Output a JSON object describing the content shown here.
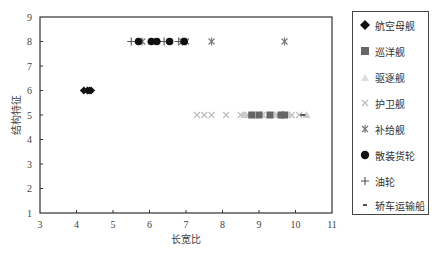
{
  "chart_data": {
    "type": "scatter",
    "title": "",
    "xlabel": "长宽比",
    "ylabel": "结构特征",
    "xlim": [
      3,
      11
    ],
    "ylim": [
      1,
      9
    ],
    "x_ticks": [
      3,
      4,
      5,
      6,
      7,
      8,
      9,
      10,
      11
    ],
    "y_ticks": [
      1,
      2,
      3,
      4,
      5,
      6,
      7,
      8,
      9
    ],
    "grid": false,
    "legend_position": "right",
    "series": [
      {
        "name": "航空母舰",
        "marker": "diamond",
        "color": "#111111",
        "points": [
          [
            4.2,
            6
          ],
          [
            4.3,
            6
          ],
          [
            4.35,
            6
          ],
          [
            4.4,
            6
          ]
        ]
      },
      {
        "name": "巡洋舰",
        "marker": "square",
        "color": "#666666",
        "points": [
          [
            8.8,
            5
          ],
          [
            9.0,
            5
          ],
          [
            9.3,
            5
          ],
          [
            9.6,
            5
          ],
          [
            9.7,
            5
          ]
        ]
      },
      {
        "name": "驱逐舰",
        "marker": "triangle",
        "color": "#cccccc",
        "points": [
          [
            8.6,
            5
          ],
          [
            8.8,
            5
          ],
          [
            9.1,
            5
          ],
          [
            9.4,
            5
          ],
          [
            9.8,
            5
          ],
          [
            10.3,
            5
          ]
        ]
      },
      {
        "name": "护卫舰",
        "marker": "x",
        "color": "#bbbbbb",
        "points": [
          [
            7.3,
            5
          ],
          [
            7.5,
            5
          ],
          [
            7.7,
            5
          ],
          [
            8.1,
            5
          ],
          [
            8.5,
            5
          ],
          [
            8.7,
            5
          ],
          [
            9.1,
            5
          ],
          [
            9.5,
            5
          ],
          [
            9.9,
            5
          ],
          [
            10.1,
            5
          ]
        ]
      },
      {
        "name": "补给舰",
        "marker": "asterisk",
        "color": "#777777",
        "points": [
          [
            5.8,
            8
          ],
          [
            6.9,
            8
          ],
          [
            7.0,
            8
          ],
          [
            7.7,
            8
          ],
          [
            9.7,
            8
          ]
        ]
      },
      {
        "name": "散装货轮",
        "marker": "circle",
        "color": "#111111",
        "points": [
          [
            5.7,
            8
          ],
          [
            6.05,
            8
          ],
          [
            6.2,
            8
          ],
          [
            6.55,
            8
          ],
          [
            6.95,
            8
          ]
        ]
      },
      {
        "name": "油轮",
        "marker": "plus",
        "color": "#555555",
        "points": [
          [
            5.5,
            8
          ],
          [
            6.4,
            8
          ],
          [
            6.8,
            8
          ]
        ]
      },
      {
        "name": "轿车运输船",
        "marker": "dash",
        "color": "#555555",
        "points": [
          [
            10.2,
            5
          ]
        ]
      }
    ]
  },
  "axes": {
    "xlabel": "长宽比",
    "ylabel": "结构特征",
    "x_ticks": [
      "3",
      "4",
      "5",
      "6",
      "7",
      "8",
      "9",
      "10",
      "11"
    ],
    "y_ticks": [
      "1",
      "2",
      "3",
      "4",
      "5",
      "6",
      "7",
      "8",
      "9"
    ]
  },
  "legend": {
    "items": [
      {
        "label": "航空母舰",
        "icon": "diamond-icon"
      },
      {
        "label": "巡洋舰",
        "icon": "square-icon"
      },
      {
        "label": "驱逐舰",
        "icon": "triangle-icon"
      },
      {
        "label": "护卫舰",
        "icon": "x-icon"
      },
      {
        "label": "补给舰",
        "icon": "asterisk-icon"
      },
      {
        "label": "散装货轮",
        "icon": "circle-icon"
      },
      {
        "label": "油轮",
        "icon": "plus-icon"
      },
      {
        "label": "轿车运输船",
        "icon": "dash-icon"
      }
    ]
  }
}
